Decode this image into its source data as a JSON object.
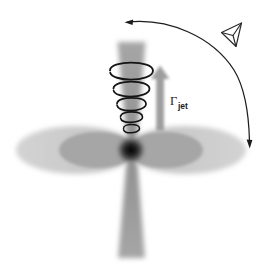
{
  "figure": {
    "background_color": "#ffffff",
    "width": 265,
    "height": 264
  },
  "labels": {
    "gamma_symbol": "Γ",
    "gamma_subscript": "jet",
    "gamma_full": "Γjet"
  },
  "colors": {
    "jet_gray": "#9a9a9a",
    "jet_gray_light": "#b4b4b4",
    "disk_outer_gray": "#c9c9c9",
    "disk_inner_gray": "#a8a8a8",
    "black_hole": "#1a1a1a",
    "arrow_gray": "#9e9e9e",
    "line_black": "#1c1c1c",
    "text_black": "#1c1c1c"
  },
  "components": {
    "black_hole": {
      "name": "central black hole",
      "cx": 131,
      "cy": 150,
      "r": 11
    },
    "accretion_disk": {
      "name": "accretion disk",
      "center_x": 131,
      "center_y": 150,
      "outer_rx": 100,
      "outer_ry": 25,
      "inner_rx": 55,
      "inner_ry": 20,
      "lobes": 2
    },
    "jet_upper": {
      "name": "approaching jet",
      "direction": "up",
      "apex_x": 131,
      "apex_y": 142,
      "top_y": 40,
      "top_half_width": 13,
      "coil_count": 5
    },
    "jet_lower": {
      "name": "counter jet",
      "direction": "down",
      "apex_x": 131,
      "apex_y": 158,
      "bottom_y": 258,
      "bottom_half_width": 13,
      "coil_count": 0
    },
    "lorentz_arrow": {
      "name": "bulk Lorentz factor arrow",
      "x": 160,
      "tail_y": 130,
      "head_y": 68,
      "shaft_width": 8,
      "head_width": 19
    },
    "viewing_angle_arc": {
      "name": "viewing angle arc",
      "start_x": 126,
      "start_y": 22,
      "end_x": 250,
      "end_y": 146,
      "arrowheads": 2,
      "start_arrow_direction": "left",
      "end_arrow_direction": "down"
    },
    "observer_eye": {
      "name": "observer viewing symbol",
      "cx": 231,
      "cy": 35,
      "size": 20
    }
  },
  "coils": [
    {
      "index": 1,
      "cy": 73,
      "rx": 22.0,
      "ry": 6.0
    },
    {
      "index": 2,
      "cy": 91,
      "rx": 18.5,
      "ry": 5.4
    },
    {
      "index": 3,
      "cy": 106,
      "rx": 15.0,
      "ry": 4.8
    },
    {
      "index": 4,
      "cy": 119,
      "rx": 11.5,
      "ry": 4.1
    },
    {
      "index": 5,
      "cy": 131,
      "rx": 8.5,
      "ry": 3.4
    }
  ]
}
